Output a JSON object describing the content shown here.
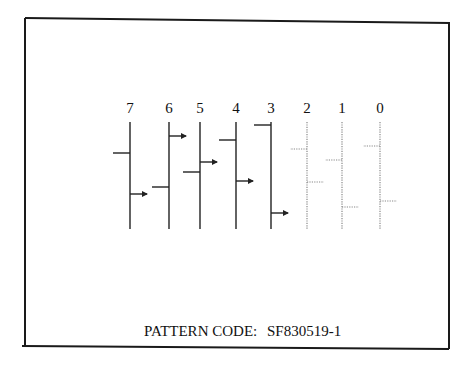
{
  "diagram": {
    "caption_label": "PATTERN CODE:",
    "caption_value": "SF830519-1",
    "colors": {
      "solid": "#222222",
      "dotted": "#888888",
      "frame": "#1a1a1a"
    },
    "channels": [
      {
        "label": "7",
        "x": 130,
        "style": "solid",
        "marks": [
          {
            "side": "left",
            "y": 153,
            "arrow": false
          },
          {
            "side": "right",
            "y": 194,
            "arrow": true
          }
        ]
      },
      {
        "label": "6",
        "x": 169,
        "style": "solid",
        "marks": [
          {
            "side": "right",
            "y": 136,
            "arrow": true
          },
          {
            "side": "left",
            "y": 187,
            "arrow": false
          }
        ]
      },
      {
        "label": "5",
        "x": 200,
        "style": "solid",
        "marks": [
          {
            "side": "right",
            "y": 162,
            "arrow": true
          },
          {
            "side": "left",
            "y": 172,
            "arrow": false
          }
        ]
      },
      {
        "label": "4",
        "x": 236,
        "style": "solid",
        "marks": [
          {
            "side": "left",
            "y": 140,
            "arrow": false
          },
          {
            "side": "right",
            "y": 181,
            "arrow": true
          }
        ]
      },
      {
        "label": "3",
        "x": 271,
        "style": "solid",
        "marks": [
          {
            "side": "left",
            "y": 125,
            "arrow": false
          },
          {
            "side": "right",
            "y": 213,
            "arrow": true
          }
        ]
      },
      {
        "label": "2",
        "x": 307,
        "style": "dotted",
        "marks": [
          {
            "side": "left",
            "y": 149,
            "arrow": false
          },
          {
            "side": "right",
            "y": 182,
            "arrow": false
          }
        ]
      },
      {
        "label": "1",
        "x": 342,
        "style": "dotted",
        "marks": [
          {
            "side": "left",
            "y": 160,
            "arrow": false
          },
          {
            "side": "right",
            "y": 207,
            "arrow": false
          }
        ]
      },
      {
        "label": "0",
        "x": 380,
        "style": "dotted",
        "marks": [
          {
            "side": "left",
            "y": 146,
            "arrow": false
          },
          {
            "side": "right",
            "y": 201,
            "arrow": false
          }
        ]
      }
    ]
  }
}
